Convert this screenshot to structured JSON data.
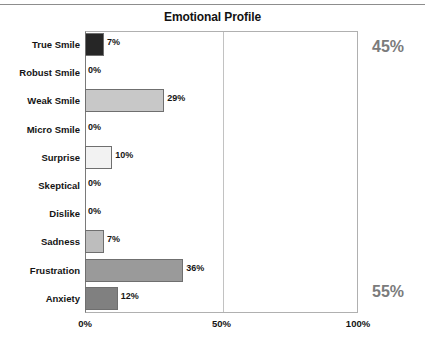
{
  "chart_data": {
    "type": "bar",
    "orientation": "horizontal",
    "title": "Emotional Profile",
    "xlabel": "",
    "ylabel": "",
    "xlim": [
      0,
      100
    ],
    "grid": true,
    "legend": null,
    "categories": [
      "True Smile",
      "Robust Smile",
      "Weak Smile",
      "Micro Smile",
      "Surprise",
      "Skeptical",
      "Dislike",
      "Sadness",
      "Frustration",
      "Anxiety"
    ],
    "values": [
      7,
      0,
      29,
      0,
      10,
      0,
      0,
      7,
      36,
      12
    ],
    "value_labels": [
      "7%",
      "0%",
      "29%",
      "0%",
      "10%",
      "0%",
      "0%",
      "7%",
      "36%",
      "12%"
    ],
    "bar_colors": [
      "#262626",
      "#ffffff",
      "#c8c8c8",
      "#ffffff",
      "#f2f2f2",
      "#ffffff",
      "#ffffff",
      "#bdbdbd",
      "#9a9a9a",
      "#808080"
    ],
    "x_ticks": [
      0,
      50,
      100
    ],
    "x_tick_labels": [
      "0%",
      "50%",
      "100%"
    ],
    "annotations": [
      {
        "name": "positive-total",
        "text": "45%",
        "position": "top-right",
        "color": "#7b7b7b"
      },
      {
        "name": "negative-total",
        "text": "55%",
        "position": "bottom-right",
        "color": "#7b7b7b"
      }
    ]
  }
}
